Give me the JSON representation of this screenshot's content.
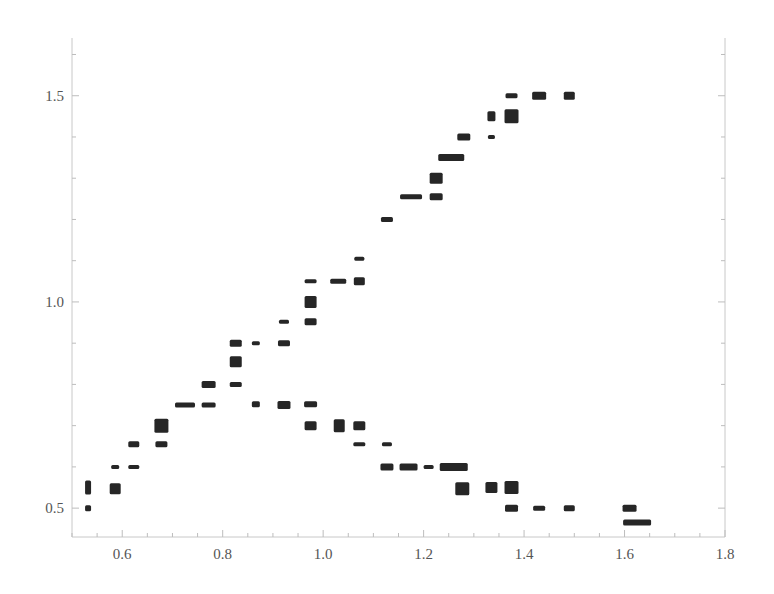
{
  "chart_data": {
    "type": "scatter",
    "title": "",
    "xlabel": "",
    "ylabel": "",
    "xlim": [
      0.5,
      1.8
    ],
    "ylim": [
      0.43,
      1.64
    ],
    "grid": false,
    "legend": null,
    "x_ticks": [
      0.6,
      0.8,
      1.0,
      1.2,
      1.4,
      1.6,
      1.8
    ],
    "x_tick_labels": [
      "0.6",
      "0.8",
      "1.0",
      "1.2",
      "1.4",
      "1.6",
      "1.8"
    ],
    "x_minor_step": 0.05,
    "y_ticks": [
      0.5,
      1.0,
      1.5
    ],
    "y_tick_labels": [
      "0.5",
      "1.0",
      "1.5"
    ],
    "y_minor_step": 0.1,
    "marker": "rectangle",
    "marker_color": "#262626",
    "series": [
      {
        "name": "points",
        "points": [
          {
            "x": 0.532,
            "y": 0.55,
            "w": 6,
            "h": 14
          },
          {
            "x": 0.532,
            "y": 0.5,
            "w": 6,
            "h": 6
          },
          {
            "x": 0.586,
            "y": 0.6,
            "w": 8,
            "h": 4
          },
          {
            "x": 0.586,
            "y": 0.547,
            "w": 11,
            "h": 11
          },
          {
            "x": 0.623,
            "y": 0.655,
            "w": 11,
            "h": 6
          },
          {
            "x": 0.623,
            "y": 0.6,
            "w": 11,
            "h": 4
          },
          {
            "x": 0.678,
            "y": 0.7,
            "w": 14,
            "h": 14
          },
          {
            "x": 0.678,
            "y": 0.655,
            "w": 12,
            "h": 6
          },
          {
            "x": 0.725,
            "y": 0.75,
            "w": 20,
            "h": 5
          },
          {
            "x": 0.772,
            "y": 0.8,
            "w": 14,
            "h": 7
          },
          {
            "x": 0.772,
            "y": 0.75,
            "w": 14,
            "h": 5
          },
          {
            "x": 0.826,
            "y": 0.9,
            "w": 12,
            "h": 7
          },
          {
            "x": 0.826,
            "y": 0.855,
            "w": 12,
            "h": 11
          },
          {
            "x": 0.826,
            "y": 0.8,
            "w": 12,
            "h": 5
          },
          {
            "x": 0.866,
            "y": 0.9,
            "w": 8,
            "h": 4
          },
          {
            "x": 0.866,
            "y": 0.752,
            "w": 8,
            "h": 6
          },
          {
            "x": 0.922,
            "y": 0.952,
            "w": 10,
            "h": 4
          },
          {
            "x": 0.922,
            "y": 0.9,
            "w": 12,
            "h": 6
          },
          {
            "x": 0.922,
            "y": 0.75,
            "w": 13,
            "h": 8
          },
          {
            "x": 0.975,
            "y": 1.05,
            "w": 12,
            "h": 4
          },
          {
            "x": 0.975,
            "y": 1.0,
            "w": 12,
            "h": 12
          },
          {
            "x": 0.975,
            "y": 0.952,
            "w": 12,
            "h": 7
          },
          {
            "x": 0.975,
            "y": 0.752,
            "w": 13,
            "h": 6
          },
          {
            "x": 0.975,
            "y": 0.7,
            "w": 12,
            "h": 9
          },
          {
            "x": 1.03,
            "y": 1.05,
            "w": 16,
            "h": 5
          },
          {
            "x": 1.032,
            "y": 0.7,
            "w": 11,
            "h": 13
          },
          {
            "x": 1.072,
            "y": 1.105,
            "w": 10,
            "h": 4
          },
          {
            "x": 1.072,
            "y": 1.05,
            "w": 11,
            "h": 8
          },
          {
            "x": 1.072,
            "y": 0.7,
            "w": 12,
            "h": 9
          },
          {
            "x": 1.072,
            "y": 0.655,
            "w": 12,
            "h": 4
          },
          {
            "x": 1.127,
            "y": 1.2,
            "w": 12,
            "h": 5
          },
          {
            "x": 1.127,
            "y": 0.655,
            "w": 10,
            "h": 4
          },
          {
            "x": 1.127,
            "y": 0.6,
            "w": 13,
            "h": 7
          },
          {
            "x": 1.175,
            "y": 1.255,
            "w": 22,
            "h": 5
          },
          {
            "x": 1.17,
            "y": 0.6,
            "w": 18,
            "h": 7
          },
          {
            "x": 1.225,
            "y": 1.3,
            "w": 13,
            "h": 11
          },
          {
            "x": 1.225,
            "y": 1.255,
            "w": 13,
            "h": 7
          },
          {
            "x": 1.21,
            "y": 0.6,
            "w": 10,
            "h": 4
          },
          {
            "x": 1.255,
            "y": 1.35,
            "w": 26,
            "h": 7
          },
          {
            "x": 1.26,
            "y": 0.6,
            "w": 28,
            "h": 8
          },
          {
            "x": 1.28,
            "y": 1.4,
            "w": 13,
            "h": 7
          },
          {
            "x": 1.277,
            "y": 0.547,
            "w": 14,
            "h": 13
          },
          {
            "x": 1.335,
            "y": 1.45,
            "w": 8,
            "h": 10
          },
          {
            "x": 1.335,
            "y": 1.4,
            "w": 7,
            "h": 4
          },
          {
            "x": 1.335,
            "y": 0.55,
            "w": 12,
            "h": 11
          },
          {
            "x": 1.375,
            "y": 1.5,
            "w": 12,
            "h": 5
          },
          {
            "x": 1.375,
            "y": 1.45,
            "w": 14,
            "h": 14
          },
          {
            "x": 1.375,
            "y": 0.55,
            "w": 14,
            "h": 13
          },
          {
            "x": 1.375,
            "y": 0.5,
            "w": 13,
            "h": 7
          },
          {
            "x": 1.43,
            "y": 1.5,
            "w": 14,
            "h": 8
          },
          {
            "x": 1.43,
            "y": 0.5,
            "w": 12,
            "h": 5
          },
          {
            "x": 1.49,
            "y": 1.5,
            "w": 11,
            "h": 8
          },
          {
            "x": 1.49,
            "y": 0.5,
            "w": 11,
            "h": 6
          },
          {
            "x": 1.61,
            "y": 0.5,
            "w": 14,
            "h": 7
          },
          {
            "x": 1.625,
            "y": 0.465,
            "w": 28,
            "h": 6
          }
        ]
      }
    ]
  }
}
